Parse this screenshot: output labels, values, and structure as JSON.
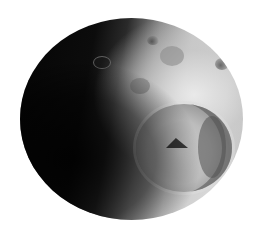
{
  "image": {
    "subject": "cratered icy moon",
    "background_color": "#ffffff",
    "features": [
      {
        "name": "large-impact-crater",
        "position": "lower-right"
      },
      {
        "name": "central-peak",
        "position": "inside large crater"
      },
      {
        "name": "terminator-shadow",
        "position": "left half"
      },
      {
        "name": "small-craters",
        "position": "upper region"
      }
    ]
  }
}
